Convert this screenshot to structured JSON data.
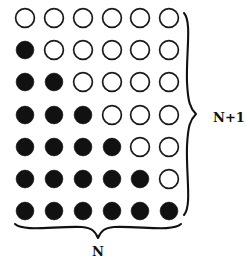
{
  "figure": {
    "name": "triangular-dot-array",
    "width": 247,
    "height": 266,
    "background_color": "#ffffff",
    "ink_color": "#111111"
  },
  "grid": {
    "rows": 7,
    "columns": 6,
    "row_count_label": "N+1",
    "column_count_label": "N",
    "first_column_x": 25,
    "first_row_y": 18,
    "column_spacing": 28.8,
    "row_spacing": 32.2,
    "open_radius": 9.4,
    "filled_radius": 8.9,
    "fill_pattern_description": "row i (1-indexed) has i-1 filled dots followed by open dots",
    "rows_filled_counts": [
      0,
      1,
      2,
      3,
      4,
      5,
      6
    ],
    "cells": [
      [
        "open",
        "open",
        "open",
        "open",
        "open",
        "open"
      ],
      [
        "filled",
        "open",
        "open",
        "open",
        "open",
        "open"
      ],
      [
        "filled",
        "filled",
        "open",
        "open",
        "open",
        "open"
      ],
      [
        "filled",
        "filled",
        "filled",
        "open",
        "open",
        "open"
      ],
      [
        "filled",
        "filled",
        "filled",
        "filled",
        "open",
        "open"
      ],
      [
        "filled",
        "filled",
        "filled",
        "filled",
        "filled",
        "open"
      ],
      [
        "filled",
        "filled",
        "filled",
        "filled",
        "filled",
        "filled"
      ]
    ],
    "total_dots": 42,
    "filled_dots": 21,
    "open_dots": 21
  },
  "braces": {
    "right": {
      "label": "N+1",
      "label_x": 213,
      "label_y": 118,
      "orientation": "vertical",
      "spans": "all 7 rows"
    },
    "bottom": {
      "label": "N",
      "label_x": 98,
      "label_y": 252,
      "orientation": "horizontal",
      "spans": "all 6 columns"
    }
  }
}
